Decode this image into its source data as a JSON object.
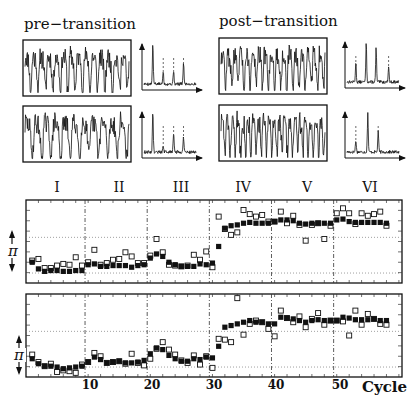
{
  "chart_data": [
    {
      "type": "line",
      "title": "pre-transition",
      "description": "Two time-series traces with their power spectra (sharp peaks with dashed harmonic markers)",
      "panels": [
        "trace-1",
        "trace-2"
      ],
      "spectrum_harmonics": 3
    },
    {
      "type": "line",
      "title": "post-transition",
      "description": "Two time-series traces with their power spectra (peaks with dashed markers)",
      "panels": [
        "trace-1",
        "trace-2"
      ],
      "spectrum_harmonics": 3
    },
    {
      "type": "scatter",
      "title": "Upper phase panel",
      "xlabel": "Cycle",
      "ylabel": "π",
      "xlim": [
        0,
        60
      ],
      "xticks": [
        10,
        20,
        30,
        40,
        50
      ],
      "segments": [
        "I",
        "II",
        "III",
        "IV",
        "V",
        "VI"
      ],
      "segment_boundaries": [
        9.5,
        19.5,
        29.5,
        39.5,
        49.5
      ],
      "y_units": "fraction of panel height (0=bottom, 1=top)",
      "series": [
        {
          "name": "filled squares",
          "marker": "filled-square",
          "x": [
            1,
            2,
            3,
            4,
            5,
            6,
            7,
            8,
            9,
            10,
            11,
            12,
            13,
            14,
            15,
            16,
            17,
            18,
            19,
            20,
            21,
            22,
            23,
            24,
            25,
            26,
            27,
            28,
            29,
            30,
            31,
            32,
            33,
            34,
            35,
            36,
            37,
            38,
            39,
            40,
            41,
            42,
            43,
            44,
            45,
            46,
            47,
            48,
            49,
            50,
            51,
            52,
            53,
            54,
            55,
            56,
            57,
            58
          ],
          "y": [
            0.25,
            0.17,
            0.14,
            0.15,
            0.15,
            0.14,
            0.14,
            0.15,
            0.15,
            0.22,
            0.23,
            0.2,
            0.2,
            0.21,
            0.21,
            0.21,
            0.19,
            0.21,
            0.22,
            0.3,
            0.35,
            0.32,
            0.25,
            0.22,
            0.2,
            0.2,
            0.2,
            0.23,
            0.22,
            0.24,
            0.44,
            0.66,
            0.69,
            0.7,
            0.72,
            0.73,
            0.72,
            0.72,
            0.72,
            0.74,
            0.76,
            0.76,
            0.75,
            0.72,
            0.71,
            0.72,
            0.72,
            0.72,
            0.72,
            0.76,
            0.77,
            0.74,
            0.73,
            0.73,
            0.73,
            0.73,
            0.73,
            0.72
          ]
        },
        {
          "name": "open squares",
          "marker": "open-square",
          "x": [
            1,
            2,
            3,
            4,
            5,
            6,
            7,
            8,
            9,
            10,
            11,
            12,
            13,
            14,
            15,
            16,
            17,
            18,
            19,
            20,
            21,
            22,
            23,
            24,
            25,
            26,
            27,
            28,
            29,
            30,
            31,
            32,
            33,
            34,
            35,
            36,
            37,
            38,
            39,
            40,
            41,
            42,
            43,
            44,
            45,
            46,
            47,
            48,
            49,
            50,
            51,
            52,
            53,
            54,
            55,
            56,
            57,
            58
          ],
          "y": [
            0.27,
            0.29,
            0.18,
            0.18,
            0.21,
            0.23,
            0.22,
            0.31,
            0.21,
            0.25,
            0.4,
            0.22,
            0.24,
            0.28,
            0.29,
            0.37,
            0.32,
            0.24,
            0.24,
            0.33,
            0.53,
            0.37,
            0.22,
            0.21,
            0.2,
            0.21,
            0.34,
            0.28,
            0.38,
            0.19,
            0.8,
            0.65,
            0.58,
            0.61,
            0.88,
            0.83,
            0.8,
            0.82,
            0.74,
            0.74,
            0.86,
            0.72,
            0.81,
            0.7,
            0.51,
            0.7,
            0.72,
            0.53,
            0.69,
            0.84,
            0.9,
            0.84,
            0.71,
            0.84,
            0.81,
            0.83,
            0.86,
            0.69
          ]
        }
      ]
    },
    {
      "type": "scatter",
      "title": "Lower phase panel",
      "xlabel": "Cycle",
      "ylabel": "π",
      "xlim": [
        0,
        60
      ],
      "xticks": [
        10,
        20,
        30,
        40,
        50
      ],
      "segment_boundaries": [
        9.5,
        19.5,
        29.5,
        39.5,
        49.5
      ],
      "y_units": "fraction of panel height (0=bottom, 1=top)",
      "series": [
        {
          "name": "filled squares",
          "marker": "filled-square",
          "x": [
            1,
            2,
            3,
            4,
            5,
            6,
            7,
            8,
            9,
            10,
            11,
            12,
            13,
            14,
            15,
            16,
            17,
            18,
            19,
            20,
            21,
            22,
            23,
            24,
            25,
            26,
            27,
            28,
            29,
            30,
            31,
            32,
            33,
            34,
            35,
            36,
            37,
            38,
            39,
            40,
            41,
            42,
            43,
            44,
            45,
            46,
            47,
            48,
            49,
            50,
            51,
            52,
            53,
            54,
            55,
            56,
            57,
            58
          ],
          "y": [
            0.22,
            0.16,
            0.13,
            0.13,
            0.12,
            0.1,
            0.11,
            0.12,
            0.13,
            0.18,
            0.24,
            0.21,
            0.17,
            0.18,
            0.19,
            0.17,
            0.17,
            0.18,
            0.2,
            0.28,
            0.35,
            0.33,
            0.26,
            0.22,
            0.19,
            0.19,
            0.22,
            0.21,
            0.24,
            0.23,
            0.37,
            0.6,
            0.62,
            0.64,
            0.66,
            0.68,
            0.66,
            0.66,
            0.64,
            0.64,
            0.72,
            0.71,
            0.7,
            0.68,
            0.66,
            0.68,
            0.69,
            0.68,
            0.68,
            0.68,
            0.72,
            0.71,
            0.69,
            0.69,
            0.69,
            0.7,
            0.68,
            0.68
          ]
        },
        {
          "name": "open squares",
          "marker": "open-square",
          "x": [
            1,
            2,
            3,
            4,
            5,
            6,
            7,
            8,
            9,
            10,
            11,
            12,
            13,
            14,
            15,
            16,
            17,
            18,
            19,
            20,
            21,
            22,
            23,
            24,
            25,
            26,
            27,
            28,
            29,
            30,
            31,
            32,
            33,
            34,
            35,
            36,
            37,
            38,
            39,
            40,
            41,
            42,
            43,
            44,
            45,
            46,
            47,
            48,
            49,
            50,
            51,
            52,
            53,
            54,
            55,
            56,
            57,
            58
          ],
          "y": [
            0.27,
            0.18,
            0.13,
            0.16,
            0.06,
            0.08,
            0.07,
            0.05,
            0.15,
            0.18,
            0.29,
            0.25,
            0.17,
            0.18,
            0.19,
            0.16,
            0.28,
            0.17,
            0.14,
            0.22,
            0.34,
            0.42,
            0.33,
            0.27,
            0.2,
            0.17,
            0.26,
            0.15,
            0.25,
            0.11,
            0.46,
            0.45,
            0.42,
            0.95,
            0.51,
            0.64,
            0.68,
            0.66,
            0.58,
            0.49,
            0.8,
            0.71,
            0.66,
            0.73,
            0.6,
            0.7,
            0.77,
            0.63,
            0.68,
            0.68,
            0.67,
            0.5,
            0.8,
            0.63,
            0.76,
            0.7,
            0.64,
            0.63
          ]
        }
      ]
    }
  ],
  "labels": {
    "pre": "pre−transition",
    "post": "post−transition",
    "segments": [
      "I",
      "II",
      "III",
      "IV",
      "V",
      "VI"
    ],
    "xticks": [
      "10",
      "20",
      "30",
      "40",
      "50"
    ],
    "xlabel": "Cycle",
    "ylabel": "π"
  }
}
